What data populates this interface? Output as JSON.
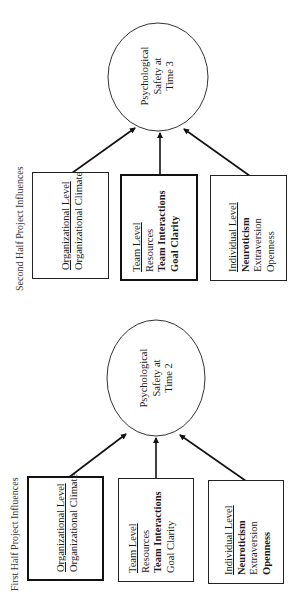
{
  "panels": [
    {
      "id": "first-half",
      "title": "First Half Project Influences",
      "outcome": {
        "lines": [
          "Psychological",
          "Safety at",
          "Time 2"
        ]
      },
      "boxes": [
        {
          "id": "organizational",
          "heading": "Organizational Level",
          "items": [
            {
              "label": "Organizational Climate",
              "bold": false
            }
          ],
          "emphasized": true
        },
        {
          "id": "team",
          "heading": "Team Level",
          "items": [
            {
              "label": "Resources",
              "bold": false
            },
            {
              "label": "Team Interactions",
              "bold": true
            },
            {
              "label": "Goal Clarity",
              "bold": false
            }
          ],
          "emphasized": false
        },
        {
          "id": "individual",
          "heading": "Individual Level",
          "items": [
            {
              "label": "Neuroticism",
              "bold": true
            },
            {
              "label": "Extraversion",
              "bold": false
            },
            {
              "label": "Openness",
              "bold": true
            }
          ],
          "emphasized": false
        }
      ]
    },
    {
      "id": "second-half",
      "title": "Second Half Project Influences",
      "outcome": {
        "lines": [
          "Psychological",
          "Safety at",
          "Time 3"
        ]
      },
      "boxes": [
        {
          "id": "organizational",
          "heading": "Organizational Level",
          "items": [
            {
              "label": "Organizational Climate",
              "bold": false
            }
          ],
          "emphasized": false
        },
        {
          "id": "team",
          "heading": "Team Level",
          "items": [
            {
              "label": "Resources",
              "bold": false
            },
            {
              "label": "Team Interactions",
              "bold": true
            },
            {
              "label": "Goal Clarity",
              "bold": true
            }
          ],
          "emphasized": true
        },
        {
          "id": "individual",
          "heading": "Individual Level",
          "items": [
            {
              "label": "Neuroticism",
              "bold": true
            },
            {
              "label": "Extraversion",
              "bold": false
            },
            {
              "label": "Openness",
              "bold": false
            }
          ],
          "emphasized": false
        }
      ]
    }
  ],
  "colors": {
    "stroke": "#1a1a1a",
    "background": "#ffffff"
  }
}
